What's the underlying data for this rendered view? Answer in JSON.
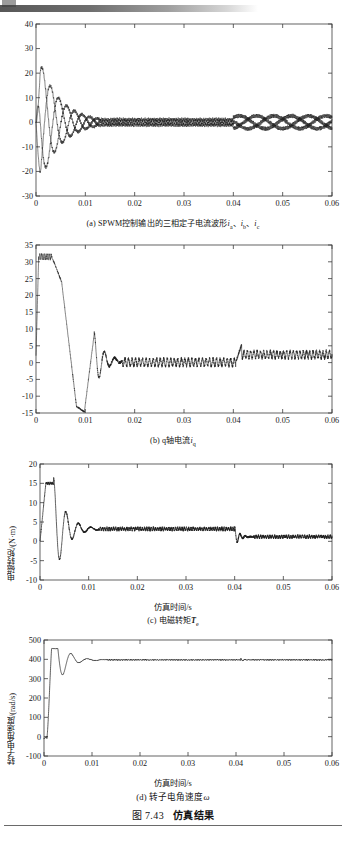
{
  "page": {
    "figure_caption_number": "图 7.43",
    "figure_caption_title": "仿真结果"
  },
  "chart_data": [
    {
      "id": "a",
      "type": "line",
      "title": "",
      "caption_prefix": "(a)",
      "caption_text": "SPWM控制输出的三相定子电流波形",
      "caption_symbols": "i_a、i_b、i_c",
      "xlabel": "",
      "ylabel": "",
      "xlim": [
        0,
        0.06
      ],
      "ylim": [
        -30,
        40
      ],
      "xticks": [
        0,
        0.01,
        0.02,
        0.03,
        0.04,
        0.05,
        0.06
      ],
      "xticklabels": [
        "0",
        "0.01",
        "0.02",
        "0.03",
        "0.04",
        "0.05",
        "0.06"
      ],
      "yticks": [
        -30,
        -20,
        -10,
        0,
        10,
        20,
        30,
        40
      ],
      "yticklabels": [
        "-30",
        "-20",
        "-10",
        "0",
        "10",
        "20",
        "30",
        "40"
      ],
      "grid": false,
      "series": [
        {
          "name": "i_a",
          "peak_initial": 30,
          "note": "三相定子电流 a 相"
        },
        {
          "name": "i_b",
          "peak_initial": -29,
          "note": "三相定子电流 b 相"
        },
        {
          "name": "i_c",
          "peak_initial": 22,
          "note": "三相定子电流 c 相"
        }
      ],
      "events": {
        "settle_time": 0.013,
        "step_time": 0.04,
        "steady_amplitude": 2.5
      }
    },
    {
      "id": "b",
      "type": "line",
      "title": "",
      "caption_prefix": "(b)",
      "caption_text": "q轴电流",
      "caption_symbols": "i_q",
      "xlabel": "",
      "ylabel": "",
      "xlim": [
        0,
        0.06
      ],
      "ylim": [
        -15,
        35
      ],
      "xticks": [
        0,
        0.01,
        0.02,
        0.03,
        0.04,
        0.05,
        0.06
      ],
      "xticklabels": [
        "0",
        "0.01",
        "0.02",
        "0.03",
        "0.04",
        "0.05",
        "0.06"
      ],
      "yticks": [
        -15,
        -10,
        -5,
        0,
        5,
        10,
        15,
        20,
        25,
        30,
        35
      ],
      "yticklabels": [
        "-15",
        "-10",
        "-5",
        "0",
        "5",
        "10",
        "15",
        "20",
        "25",
        "30",
        "35"
      ],
      "grid": false,
      "series": [
        {
          "name": "i_q",
          "peak": 32,
          "min": -14.7,
          "steady_before_step": 0,
          "steady_after_step": 2.3
        }
      ],
      "events": {
        "peak_time": 0.002,
        "dip_time": 0.0098,
        "step_time": 0.0405
      }
    },
    {
      "id": "c",
      "type": "line",
      "title": "",
      "caption_prefix": "(c)",
      "caption_text": "电磁转矩",
      "caption_symbols": "T_e",
      "xlabel": "仿真时间/s",
      "ylabel": "电磁转矩/(N·m)",
      "xlim": [
        0,
        0.06
      ],
      "ylim": [
        -10,
        20
      ],
      "xticks": [
        0,
        0.01,
        0.02,
        0.03,
        0.04,
        0.05,
        0.06
      ],
      "xticklabels": [
        "0",
        "0.01",
        "0.02",
        "0.03",
        "0.04",
        "0.05",
        "0.06"
      ],
      "yticks": [
        -10,
        -5,
        0,
        5,
        10,
        15,
        20
      ],
      "yticklabels": [
        "-10",
        "-5",
        "0",
        "5",
        "10",
        "15",
        "20"
      ],
      "grid": false,
      "series": [
        {
          "name": "T_e",
          "peak": 15,
          "min": -7,
          "steady_before_step": 3.2,
          "steady_after_step": 1.2
        }
      ],
      "events": {
        "clip_start": 0.0012,
        "clip_end": 0.0028,
        "step_time": 0.04
      }
    },
    {
      "id": "d",
      "type": "line",
      "title": "",
      "caption_prefix": "(d)",
      "caption_text": "转子电角速度",
      "caption_symbols": "ω",
      "xlabel": "仿真时间/s",
      "ylabel": "转子电角速度/(rad/s)",
      "xlim": [
        0,
        0.06
      ],
      "ylim": [
        -100,
        500
      ],
      "xticks": [
        0,
        0.01,
        0.02,
        0.03,
        0.04,
        0.05,
        0.06
      ],
      "xticklabels": [
        "0",
        "0.01",
        "0.02",
        "0.03",
        "0.04",
        "0.05",
        "0.06"
      ],
      "yticks": [
        -100,
        0,
        100,
        200,
        300,
        400,
        500
      ],
      "yticklabels": [
        "-100",
        "0",
        "100",
        "200",
        "300",
        "400",
        "500"
      ],
      "grid": false,
      "series": [
        {
          "name": "ω",
          "overshoot_peak": 452,
          "steady_value": 397,
          "start_value": -10
        }
      ],
      "events": {
        "overshoot_time": 0.004,
        "settle_time": 0.013,
        "step_time": 0.041
      }
    }
  ]
}
